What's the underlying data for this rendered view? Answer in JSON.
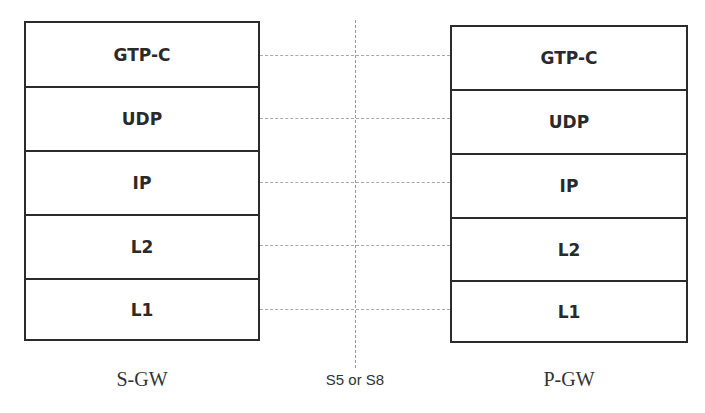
{
  "diagram": {
    "left_node": {
      "label": "S-GW",
      "layers": [
        "GTP-C",
        "UDP",
        "IP",
        "L2",
        "L1"
      ]
    },
    "right_node": {
      "label": "P-GW",
      "layers": [
        "GTP-C",
        "UDP",
        "IP",
        "L2",
        "L1"
      ]
    },
    "interface": {
      "label": "S5 or S8"
    },
    "colors": {
      "border": "#2b2b2b",
      "text": "#2a2a2a",
      "connector": "#a8a8a8",
      "background": "#ffffff"
    }
  }
}
